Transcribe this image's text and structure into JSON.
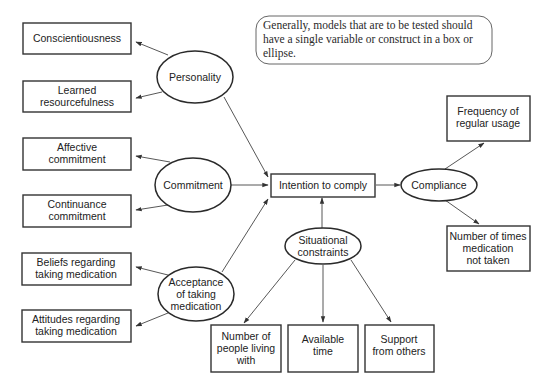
{
  "note": {
    "lines": [
      "Generally, models that are to be tested should",
      "have a single variable or construct in a box or",
      "ellipse."
    ]
  },
  "nodes": {
    "conscientiousness": {
      "shape": "box",
      "lines": [
        "Conscientiousness"
      ]
    },
    "learned_resourcefulness": {
      "shape": "box",
      "lines": [
        "Learned",
        "resourcefulness"
      ]
    },
    "affective_commitment": {
      "shape": "box",
      "lines": [
        "Affective",
        "commitment"
      ]
    },
    "continuance_commitment": {
      "shape": "box",
      "lines": [
        "Continuance",
        "commitment"
      ]
    },
    "beliefs": {
      "shape": "box",
      "lines": [
        "Beliefs regarding",
        "taking medication"
      ]
    },
    "attitudes": {
      "shape": "box",
      "lines": [
        "Attitudes regarding",
        "taking medication"
      ]
    },
    "personality": {
      "shape": "ellipse",
      "lines": [
        "Personality"
      ]
    },
    "commitment": {
      "shape": "ellipse",
      "lines": [
        "Commitment"
      ]
    },
    "acceptance": {
      "shape": "ellipse",
      "lines": [
        "Acceptance",
        "of taking",
        "medication"
      ]
    },
    "intention": {
      "shape": "box",
      "lines": [
        "Intention to comply"
      ]
    },
    "compliance": {
      "shape": "ellipse",
      "lines": [
        "Compliance"
      ]
    },
    "frequency": {
      "shape": "box",
      "lines": [
        "Frequency of",
        "regular usage"
      ]
    },
    "times_not_taken": {
      "shape": "box",
      "lines": [
        "Number of times",
        "medication",
        "not taken"
      ]
    },
    "situational": {
      "shape": "ellipse",
      "lines": [
        "Situational",
        "constraints"
      ]
    },
    "people_living_with": {
      "shape": "box",
      "lines": [
        "Number of",
        "people living",
        "with"
      ]
    },
    "available_time": {
      "shape": "box",
      "lines": [
        "Available",
        "time"
      ]
    },
    "support": {
      "shape": "box",
      "lines": [
        "Support",
        "from others"
      ]
    }
  },
  "edges": [
    {
      "from": "personality",
      "to": "conscientiousness"
    },
    {
      "from": "personality",
      "to": "learned_resourcefulness"
    },
    {
      "from": "personality",
      "to": "intention"
    },
    {
      "from": "commitment",
      "to": "affective_commitment"
    },
    {
      "from": "commitment",
      "to": "continuance_commitment"
    },
    {
      "from": "commitment",
      "to": "intention"
    },
    {
      "from": "acceptance",
      "to": "beliefs"
    },
    {
      "from": "acceptance",
      "to": "attitudes"
    },
    {
      "from": "acceptance",
      "to": "intention"
    },
    {
      "from": "intention",
      "to": "compliance"
    },
    {
      "from": "compliance",
      "to": "frequency"
    },
    {
      "from": "compliance",
      "to": "times_not_taken"
    },
    {
      "from": "situational",
      "to": "intention"
    },
    {
      "from": "situational",
      "to": "people_living_with"
    },
    {
      "from": "situational",
      "to": "available_time"
    },
    {
      "from": "situational",
      "to": "support"
    }
  ]
}
